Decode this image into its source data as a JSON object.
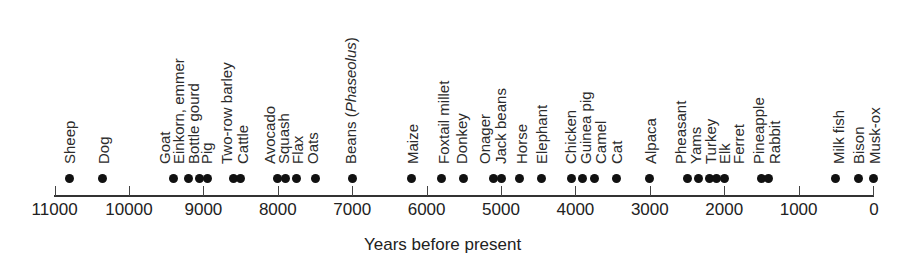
{
  "chart_data": {
    "type": "scatter",
    "title": "",
    "xlabel": "Years before present",
    "ylabel": "",
    "xlim": [
      11000,
      0
    ],
    "x_reversed": true,
    "grid": false,
    "legend": null,
    "xticks": [
      11000,
      10000,
      9000,
      8000,
      7000,
      6000,
      5000,
      4000,
      3000,
      2000,
      1000,
      0
    ],
    "xtick_labels": [
      "11000",
      "10000",
      "9000",
      "8000",
      "7000",
      "6000",
      "5000",
      "4000",
      "3000",
      "2000",
      "1000",
      "0"
    ],
    "points": [
      {
        "name": "Sheep",
        "years": 10800,
        "label_x": 62
      },
      {
        "name": "Dog",
        "years": 10350,
        "label_x": 96
      },
      {
        "name": "Goat",
        "years": 9400,
        "label_x": 157
      },
      {
        "name": "Einkorn, emmer",
        "years": 9200,
        "label_x": 171
      },
      {
        "name": "Bottle gourd",
        "years": 9050,
        "label_x": 186
      },
      {
        "name": "Pig",
        "years": 8950,
        "label_x": 199
      },
      {
        "name": "Two-row barley",
        "years": 8600,
        "label_x": 219
      },
      {
        "name": "Cattle",
        "years": 8500,
        "label_x": 235
      },
      {
        "name": "Avocado",
        "years": 8000,
        "label_x": 262
      },
      {
        "name": "Squash",
        "years": 7900,
        "label_x": 276
      },
      {
        "name": "Flax",
        "years": 7750,
        "label_x": 290
      },
      {
        "name": "Oats",
        "years": 7500,
        "label_x": 305
      },
      {
        "name": "Beans (",
        "italic": "Phaseolus",
        "suffix": ")",
        "years": 7000,
        "label_x": 343
      },
      {
        "name": "Maize",
        "years": 6200,
        "label_x": 405
      },
      {
        "name": "Foxtail millet",
        "years": 5800,
        "label_x": 436
      },
      {
        "name": "Donkey",
        "years": 5500,
        "label_x": 454
      },
      {
        "name": "Onager",
        "years": 5100,
        "label_x": 477
      },
      {
        "name": "Jack beans",
        "years": 5000,
        "label_x": 493
      },
      {
        "name": "Horse",
        "years": 4750,
        "label_x": 514
      },
      {
        "name": "Elephant",
        "years": 4450,
        "label_x": 534
      },
      {
        "name": "Chicken",
        "years": 4050,
        "label_x": 563
      },
      {
        "name": "Guinea pig",
        "years": 3900,
        "label_x": 578
      },
      {
        "name": "Camel",
        "years": 3750,
        "label_x": 593
      },
      {
        "name": "Cat",
        "years": 3450,
        "label_x": 609
      },
      {
        "name": "Alpaca",
        "years": 3000,
        "label_x": 643
      },
      {
        "name": "Pheasant",
        "years": 2500,
        "label_x": 673
      },
      {
        "name": "Yams",
        "years": 2350,
        "label_x": 688
      },
      {
        "name": "Turkey",
        "years": 2200,
        "label_x": 703
      },
      {
        "name": "Elk",
        "years": 2100,
        "label_x": 717
      },
      {
        "name": "Ferret",
        "years": 2000,
        "label_x": 731
      },
      {
        "name": "Pineapple",
        "years": 1500,
        "label_x": 751
      },
      {
        "name": "Rabbit",
        "years": 1400,
        "label_x": 767
      },
      {
        "name": "Milk fish",
        "years": 500,
        "label_x": 831
      },
      {
        "name": "Bison",
        "years": 200,
        "label_x": 851
      },
      {
        "name": "Musk-ox",
        "years": 0,
        "label_x": 867
      }
    ]
  },
  "axis": {
    "xlabel": "Years before present"
  }
}
